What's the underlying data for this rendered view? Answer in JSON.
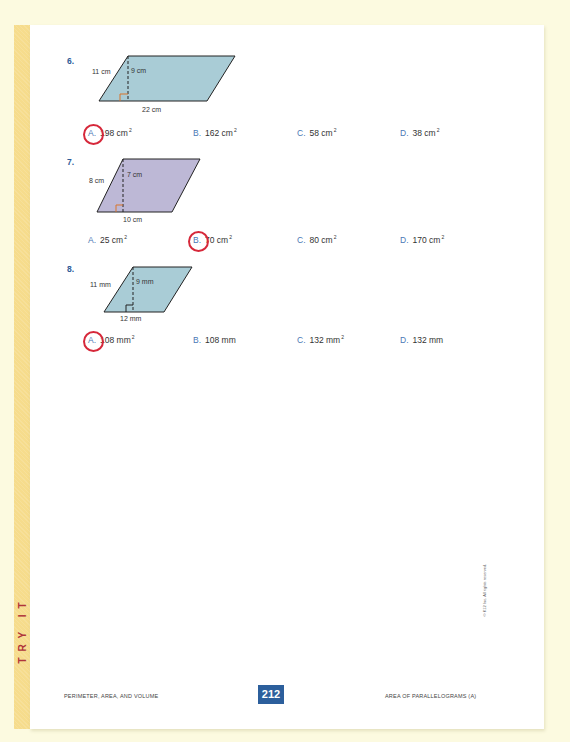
{
  "side_label": "TRY IT",
  "problems": [
    {
      "number": "6.",
      "side": "11 cm",
      "height": "9 cm",
      "base": "22 cm",
      "fill": "#a9ccd6",
      "choices": [
        {
          "letter": "A.",
          "value": "198 cm",
          "unit_exp": "2",
          "selected": true
        },
        {
          "letter": "B.",
          "value": "162 cm",
          "unit_exp": "2",
          "selected": false
        },
        {
          "letter": "C.",
          "value": "58 cm",
          "unit_exp": "2",
          "selected": false
        },
        {
          "letter": "D.",
          "value": "38 cm",
          "unit_exp": "2",
          "selected": false
        }
      ]
    },
    {
      "number": "7.",
      "side": "8 cm",
      "height": "7 cm",
      "base": "10 cm",
      "fill": "#bdb8d6",
      "choices": [
        {
          "letter": "A.",
          "value": "25 cm",
          "unit_exp": "2",
          "selected": false
        },
        {
          "letter": "B.",
          "value": "70 cm",
          "unit_exp": "2",
          "selected": true
        },
        {
          "letter": "C.",
          "value": "80 cm",
          "unit_exp": "2",
          "selected": false
        },
        {
          "letter": "D.",
          "value": "170 cm",
          "unit_exp": "2",
          "selected": false
        }
      ]
    },
    {
      "number": "8.",
      "side": "11 mm",
      "height": "9 mm",
      "base": "12 mm",
      "fill": "#a9ccd6",
      "choices": [
        {
          "letter": "A.",
          "value": "108 mm",
          "unit_exp": "2",
          "selected": true
        },
        {
          "letter": "B.",
          "value": "108 mm",
          "unit_exp": "",
          "selected": false
        },
        {
          "letter": "C.",
          "value": "132 mm",
          "unit_exp": "2",
          "selected": false
        },
        {
          "letter": "D.",
          "value": "132 mm",
          "unit_exp": "",
          "selected": false
        }
      ]
    }
  ],
  "footer": {
    "left": "PERIMETER, AREA, AND VOLUME",
    "page_number": "212",
    "right": "AREA OF PARALLELOGRAMS (A)",
    "copyright": "© K12 Inc. All rights reserved."
  },
  "colors": {
    "background": "#fcfae0",
    "side_band": "#f6dc8c",
    "side_label": "#b0353a",
    "problem_number": "#2d5b98",
    "answer_circle": "#d6283a",
    "page_number_bg": "#2c5f9c",
    "right_angle_marker": "#d9742b"
  }
}
